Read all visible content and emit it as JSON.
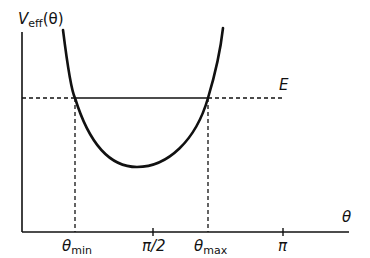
{
  "diagram": {
    "y_axis": {
      "label_main": "V",
      "label_sub": "eff",
      "label_arg": "(θ)"
    },
    "x_axis": {
      "label": "θ",
      "ticks": [
        {
          "id": "theta_min",
          "main": "θ",
          "sub": "min",
          "x": 75
        },
        {
          "id": "pi_half",
          "main": "π/2",
          "sub": "",
          "x": 153
        },
        {
          "id": "theta_max",
          "main": "θ",
          "sub": "max",
          "x": 208
        },
        {
          "id": "pi",
          "main": "π",
          "sub": "",
          "x": 283
        }
      ]
    },
    "energy_line": {
      "label": "E",
      "y": 98
    },
    "curve": {
      "description": "U-shaped effective potential with minimum between θmin and θmax",
      "min_point": {
        "x": 137,
        "y": 167
      }
    },
    "colors": {
      "stroke": "#111111",
      "background": "#ffffff"
    }
  }
}
